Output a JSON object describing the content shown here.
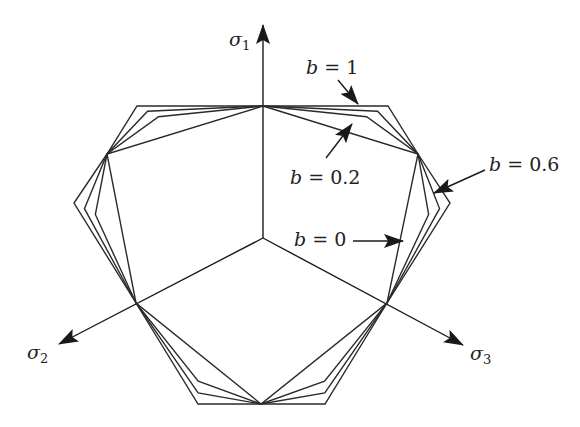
{
  "colors": {
    "line": "#2a2a2a",
    "background": "#ffffff"
  },
  "axes": [
    {
      "id": "sigma1",
      "symbol": "σ",
      "subscript": "1",
      "tip": [
        263,
        25
      ]
    },
    {
      "id": "sigma2",
      "symbol": "σ",
      "subscript": "2",
      "tip": [
        59,
        344
      ]
    },
    {
      "id": "sigma3",
      "symbol": "σ",
      "subscript": "3",
      "tip": [
        463,
        345
      ]
    }
  ],
  "origin": [
    263,
    238
  ],
  "inner_vertices": [
    [
      263,
      106
    ],
    [
      418,
      154
    ],
    [
      387,
      303
    ],
    [
      261,
      404
    ],
    [
      136,
      303
    ],
    [
      107,
      154
    ]
  ],
  "outer_corners": [
    [
      388,
      106
    ],
    [
      450,
      203
    ],
    [
      325,
      404
    ],
    [
      198,
      404
    ],
    [
      74,
      203
    ],
    [
      137,
      106
    ]
  ],
  "loci": [
    {
      "name": "b = 0",
      "b": 0,
      "t": 0.0
    },
    {
      "name": "b = 0.2",
      "b": 0.2,
      "t": 0.55
    },
    {
      "name": "b = 0.6",
      "b": 0.6,
      "t": 0.78
    },
    {
      "name": "b = 1",
      "b": 1,
      "t": 1.0
    }
  ],
  "annotations": [
    {
      "id": "b1",
      "var": "b",
      "text": " = 1",
      "label_pos": [
        306,
        58
      ],
      "arrow": [
        [
          338,
          80
        ],
        [
          358,
          104
        ]
      ]
    },
    {
      "id": "b02",
      "var": "b",
      "text": " = 0.2",
      "label_pos": [
        290,
        168
      ],
      "arrow": [
        [
          326,
          158
        ],
        [
          352,
          124
        ]
      ]
    },
    {
      "id": "b06",
      "var": "b",
      "text": " = 0.6",
      "label_pos": [
        489,
        155
      ],
      "arrow": [
        [
          485,
          170
        ],
        [
          434,
          193
        ]
      ]
    },
    {
      "id": "b0",
      "var": "b",
      "text": " = 0",
      "label_pos": [
        294,
        230
      ],
      "arrow": [
        [
          353,
          241
        ],
        [
          403,
          241
        ]
      ]
    }
  ]
}
